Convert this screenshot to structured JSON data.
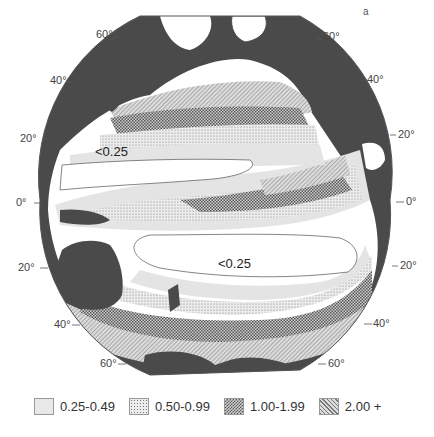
{
  "figure": {
    "panel_label": "a",
    "land_color": "#4a4a4a",
    "ocean_base_color": "#ffffff",
    "region_labels": [
      {
        "text": "<0.25",
        "position": "north-pacific-gyre"
      },
      {
        "text": "<0.25",
        "position": "south-pacific-gyre"
      }
    ]
  },
  "latitude_labels": {
    "left": [
      "60°",
      "40°",
      "20°",
      "0°",
      "20°",
      "40°",
      "60°"
    ],
    "right": [
      "60°",
      "40°",
      "20°",
      "0°",
      "20°",
      "40°",
      "60°"
    ]
  },
  "legend": {
    "items": [
      {
        "label": "0.25-0.49",
        "pattern": "light-gray-fill",
        "color": "#e4e4e4"
      },
      {
        "label": "0.50-0.99",
        "pattern": "fine-stipple",
        "color": "#d6d6d6"
      },
      {
        "label": "1.00-1.99",
        "pattern": "checker-stipple",
        "color": "#9a9a9a"
      },
      {
        "label": "2.00 +",
        "pattern": "diagonal-hatch",
        "color": "#b8b8b8"
      }
    ]
  }
}
